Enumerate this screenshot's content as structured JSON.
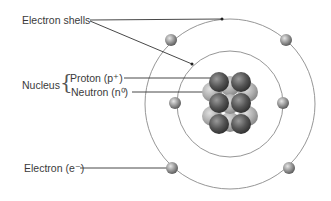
{
  "diagram": {
    "type": "atom-structure",
    "labels": {
      "electron_shells": "Electron shells",
      "nucleus": "Nucleus",
      "proton": "Proton (p⁺)",
      "neutron": "Neutron (n⁰)",
      "electron": "Electron (e⁻)"
    },
    "shells": [
      {
        "name": "inner-shell",
        "electrons": 2
      },
      {
        "name": "outer-shell",
        "electrons": 4
      }
    ],
    "colors": {
      "orbit": "#8a8a8a",
      "leader_line": "#333333",
      "proton": "#5a5a5a",
      "neutron": "#a9a9a9",
      "electron": "#8c8c8c"
    }
  }
}
